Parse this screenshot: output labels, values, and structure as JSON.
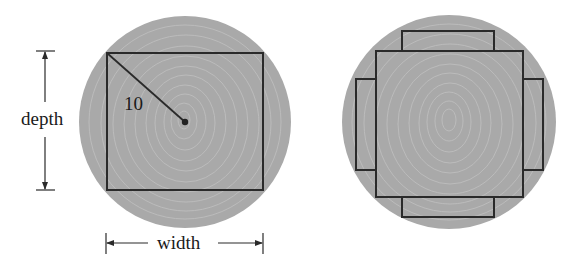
{
  "figure_left": {
    "radius_label": "10",
    "depth_label": "depth",
    "width_label": "width",
    "circle": {
      "cx": 185,
      "cy": 122,
      "r": 106
    },
    "rect": {
      "x": 107,
      "y": 53,
      "w": 156,
      "h": 137
    }
  },
  "figure_right": {
    "circle": {
      "cx": 449,
      "cy": 122,
      "r": 107
    },
    "square": {
      "x": 376,
      "y": 51,
      "w": 147,
      "h": 146
    },
    "planks": {
      "top": {
        "x": 402,
        "y": 31,
        "w": 92,
        "h": 20
      },
      "bottom": {
        "x": 402,
        "y": 197,
        "w": 92,
        "h": 20
      },
      "left": {
        "x": 356,
        "y": 79,
        "w": 20,
        "h": 91
      },
      "right": {
        "x": 523,
        "y": 79,
        "w": 20,
        "h": 91
      }
    }
  },
  "colors": {
    "log_fill": "#a9a9a9",
    "ring_stroke": "#bdbdbd",
    "line": "#2a2a2a",
    "background": "#ffffff"
  }
}
